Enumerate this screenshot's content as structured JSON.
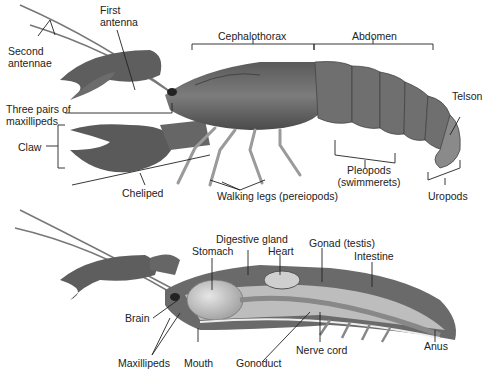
{
  "diagram": {
    "external_view": {
      "labels": {
        "first_antenna": [
          "First",
          "antenna"
        ],
        "second_antennae": [
          "Second",
          "antennae"
        ],
        "cephalothorax": "Cephalothorax",
        "abdomen": "Abdomen",
        "three_pairs_maxillipeds": [
          "Three pairs of",
          "maxillipeds"
        ],
        "claw": "Claw",
        "cheliped": "Cheliped",
        "walking_legs": "Walking legs (pereiopods)",
        "pleopods": [
          "Pleopods",
          "(swimmerets)"
        ],
        "telson": "Telson",
        "uropods": "Uropods"
      }
    },
    "internal_view": {
      "labels": {
        "digestive_gland": "Digestive gland",
        "stomach": "Stomach",
        "heart": "Heart",
        "gonad": "Gonad (testis)",
        "intestine": "Intestine",
        "brain": "Brain",
        "maxillipeds": "Maxillipeds",
        "mouth": "Mouth",
        "gonoduct": "Gonoduct",
        "nerve_cord": "Nerve cord",
        "anus": "Anus"
      }
    },
    "colors": {
      "shell_dark": "#4a4a4a",
      "shell_mid": "#7a7a7a",
      "shell_light": "#a8a8a8",
      "organ_light": "#d0d0d0",
      "leader_line": "#222222"
    }
  }
}
